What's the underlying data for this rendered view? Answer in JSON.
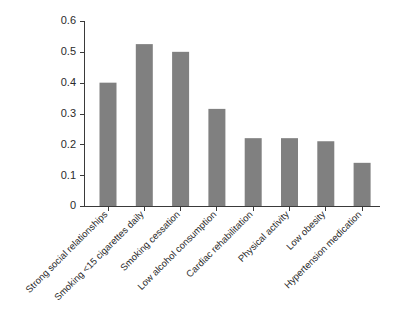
{
  "chart_data": {
    "type": "bar",
    "title": "",
    "subtitle": "",
    "xlabel": "",
    "ylabel": "",
    "ylim": [
      0,
      0.6
    ],
    "yticks": [
      "0",
      "0.1",
      "0.2",
      "0.3",
      "0.4",
      "0.5",
      "0.6"
    ],
    "ytick_values": [
      0,
      0.1,
      0.2,
      0.3,
      0.4,
      0.5,
      0.6
    ],
    "grid": false,
    "legend": false,
    "legend_position": "none",
    "bar_color": "#808080",
    "axis_color": "#3a3a3a",
    "background_color": "#ffffff",
    "xtick_rotation_deg": -45,
    "categories": [
      "Strong social relationships",
      "Smoking <15 cigarettes daily",
      "Smoking cessation",
      "Low alcohol consumption",
      "Cardiac rehabilitation",
      "Physical activity",
      "Low obesity",
      "Hypertension medication"
    ],
    "values": [
      0.4,
      0.525,
      0.5,
      0.315,
      0.22,
      0.22,
      0.21,
      0.14
    ]
  }
}
